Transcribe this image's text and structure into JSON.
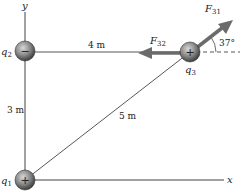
{
  "axes": {
    "x_label": "x",
    "y_label": "y"
  },
  "charges": [
    {
      "name": "q",
      "sub": "1",
      "sign": "+"
    },
    {
      "name": "q",
      "sub": "2",
      "sign": "−"
    },
    {
      "name": "q",
      "sub": "3",
      "sign": "+"
    }
  ],
  "distances": {
    "q2_q3": "4 m",
    "q1_q2": "3 m",
    "q1_q3": "5 m"
  },
  "forces": {
    "f31": {
      "name": "F",
      "sub": "31"
    },
    "f32": {
      "name": "F",
      "sub": "32"
    }
  },
  "angle": "37°",
  "colors": {
    "arrow": "#6b6b6b",
    "line": "#555555",
    "sphere": "#8a8a8a"
  }
}
